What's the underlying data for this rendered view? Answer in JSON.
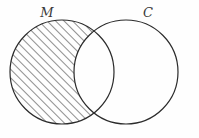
{
  "figure": {
    "type": "venn-diagram",
    "background_color": "#fefefe",
    "stroke_color": "#2b2b2b",
    "hatch_color": "#333333",
    "width": 199,
    "height": 138
  },
  "labels": {
    "left_set": "M",
    "right_set": "C"
  },
  "sets": [
    {
      "name": "M",
      "label": "M",
      "label_x": 47,
      "label_y": 17,
      "cx": 62,
      "cy": 72,
      "r": 52,
      "shaded": true
    },
    {
      "name": "C",
      "label": "C",
      "label_x": 148,
      "label_y": 17,
      "cx": 126,
      "cy": 72,
      "r": 52,
      "shaded": false
    }
  ],
  "shading": {
    "region": "M-only",
    "description": "M minus C",
    "pattern": "diagonal-hatch",
    "angle_degrees": 45,
    "spacing_px": 6,
    "line_width_px": 1.1,
    "color": "#333333"
  },
  "intersection": {
    "shaded": false,
    "top_point": [
      89,
      28
    ],
    "bottom_point": [
      89,
      116
    ]
  }
}
